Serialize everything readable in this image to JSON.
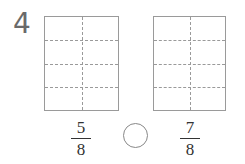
{
  "problem": {
    "number": "4",
    "left": {
      "numerator": "5",
      "denominator": "8",
      "rows": 4,
      "cols": 2
    },
    "right": {
      "numerator": "7",
      "denominator": "8",
      "rows": 4,
      "cols": 2
    },
    "comparison_answer": ""
  }
}
